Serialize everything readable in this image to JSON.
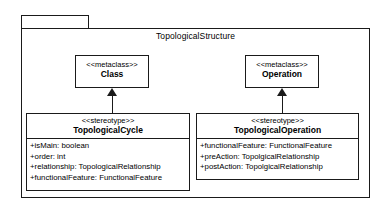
{
  "package": {
    "name": "TopologicalStructure",
    "tab_name": ""
  },
  "metaclasses": [
    {
      "stereotype": "<<metaclass>>",
      "name": "Class"
    },
    {
      "stereotype": "<<metaclass>>",
      "name": "Operation"
    }
  ],
  "stereotypes": [
    {
      "stereotype": "<<stereotype>>",
      "name": "TopologicalCycle",
      "attributes": [
        "+isMain: boolean",
        "+order: int",
        "+relationship: TopologicalRelationship",
        "+functionalFeature: FunctionalFeature"
      ]
    },
    {
      "stereotype": "<<stereotype>>",
      "name": "TopologicalOperation",
      "attributes": [
        "+functionalFeature: FunctionalFeature",
        "+preAction: TopolgicalRelationship",
        "+postAction: TopolgicalRelationship"
      ]
    }
  ],
  "relationships": [
    {
      "type": "generalization",
      "source": "TopologicalCycle",
      "target": "Class"
    },
    {
      "type": "generalization",
      "source": "TopologicalOperation",
      "target": "Operation"
    }
  ],
  "colors": {
    "stroke": "#1a1a1a",
    "fill": "#ffffff",
    "text": "#000000"
  }
}
